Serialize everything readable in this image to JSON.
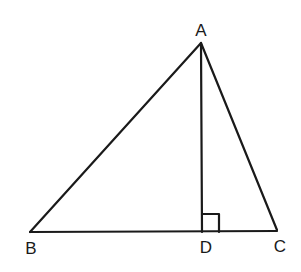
{
  "diagram": {
    "type": "geometry-triangle",
    "stroke_color": "#1a1a1a",
    "background": "#ffffff",
    "vertices": {
      "A": {
        "label": "A",
        "x": 201,
        "y": 43,
        "label_x": 201,
        "label_y": 36
      },
      "B": {
        "label": "B",
        "x": 30,
        "y": 232,
        "label_x": 31,
        "label_y": 254
      },
      "C": {
        "label": "C",
        "x": 277,
        "y": 230,
        "label_x": 280,
        "label_y": 252
      },
      "D": {
        "label": "D",
        "x": 202,
        "y": 232,
        "label_x": 206,
        "label_y": 253
      }
    },
    "segments": [
      {
        "name": "AB",
        "from": "A",
        "to": "B"
      },
      {
        "name": "AC",
        "from": "A",
        "to": "C"
      },
      {
        "name": "BC",
        "from": "B",
        "to": "C"
      },
      {
        "name": "AD",
        "from": "A",
        "to": "D",
        "note": "altitude"
      }
    ],
    "right_angle_marker": {
      "at": "D",
      "size": 17
    }
  }
}
